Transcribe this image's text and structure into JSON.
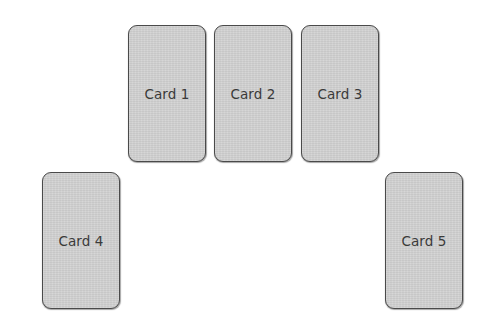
{
  "diagram": {
    "top_row": [
      {
        "id": "card-1",
        "label": "Card 1"
      },
      {
        "id": "card-2",
        "label": "Card 2"
      },
      {
        "id": "card-3",
        "label": "Card 3"
      }
    ],
    "bottom_row": [
      {
        "id": "card-4",
        "label": "Card 4"
      },
      {
        "id": "card-5",
        "label": "Card 5"
      }
    ]
  },
  "colors": {
    "background": "#ffffff",
    "card_fill": "#d2d2d2",
    "card_border": "#4a4a4a",
    "card_text": "#3a3a3a"
  }
}
